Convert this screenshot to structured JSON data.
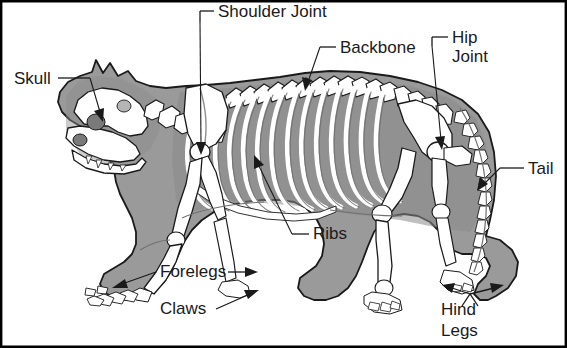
{
  "diagram": {
    "colors": {
      "background": "#ffffff",
      "body_fill": "#9a9a9a",
      "body_shadow": "#7d7d7d",
      "bone_fill": "#ffffff",
      "bone_shade": "#c9c9c9",
      "outline": "#1a1a1a",
      "label_text": "#1a1a1a",
      "border": "#000000"
    },
    "labels": [
      {
        "id": "shoulder-joint",
        "text": "Shoulder Joint",
        "lines": [
          "Shoulder Joint"
        ],
        "x": 218,
        "y": 17,
        "anchor": "start"
      },
      {
        "id": "skull",
        "text": "Skull",
        "lines": [
          "Skull"
        ],
        "x": 14,
        "y": 84,
        "anchor": "start"
      },
      {
        "id": "backbone",
        "text": "Backbone",
        "lines": [
          "Backbone"
        ],
        "x": 340,
        "y": 53,
        "anchor": "start"
      },
      {
        "id": "hip-joint",
        "text": "Hip Joint",
        "lines": [
          "Hip",
          "Joint"
        ],
        "x": 452,
        "y": 43,
        "anchor": "start"
      },
      {
        "id": "tail",
        "text": "Tail",
        "lines": [
          "Tail"
        ],
        "x": 528,
        "y": 174,
        "anchor": "start"
      },
      {
        "id": "ribs",
        "text": "Ribs",
        "lines": [
          "Ribs"
        ],
        "x": 313,
        "y": 239,
        "anchor": "start"
      },
      {
        "id": "forelegs",
        "text": "Forelegs",
        "lines": [
          "Forelegs"
        ],
        "x": 160,
        "y": 277,
        "anchor": "start"
      },
      {
        "id": "claws",
        "text": "Claws",
        "lines": [
          "Claws"
        ],
        "x": 160,
        "y": 314,
        "anchor": "start"
      },
      {
        "id": "hind-legs",
        "text": "Hind Legs",
        "lines": [
          "Hind",
          "Legs"
        ],
        "x": 441,
        "y": 315,
        "anchor": "start"
      }
    ]
  }
}
